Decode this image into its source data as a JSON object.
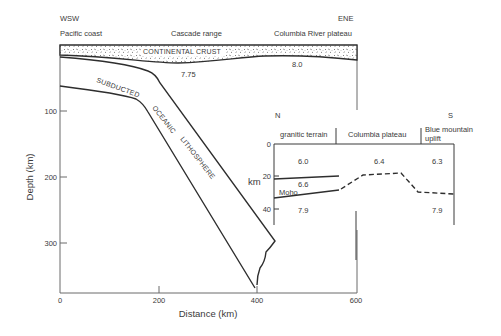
{
  "main_section": {
    "direction_left": "WSW",
    "direction_right": "ENE",
    "locations": [
      "Pacific coast",
      "Cascade range",
      "Columbia River plateau"
    ],
    "crust_label": "CONTINENTAL CRUST",
    "slab_labels": [
      "SUBDUCTED",
      "OCEANIC",
      "LITHOSPHERE"
    ],
    "velocities": [
      "7.75",
      "8.0"
    ],
    "y_axis": {
      "title": "Depth (km)",
      "ticks": [
        "100",
        "200",
        "300"
      ]
    },
    "x_axis": {
      "title": "Distance (km)",
      "ticks": [
        "0",
        "200",
        "400",
        "600"
      ]
    }
  },
  "inset_section": {
    "direction_left": "N",
    "direction_right": "S",
    "regions": [
      "granitic terrain",
      "Columbia plateau",
      "Blue mountain",
      "uplift"
    ],
    "y_axis": {
      "title": "km",
      "ticks": [
        "0",
        "20",
        "40"
      ]
    },
    "moho_label": "Moho",
    "upper_velocities": [
      "6.0",
      "6.4",
      "6.3"
    ],
    "middle_velocity": "6.6",
    "mantle_velocities": [
      "7.9",
      "7.9"
    ]
  }
}
